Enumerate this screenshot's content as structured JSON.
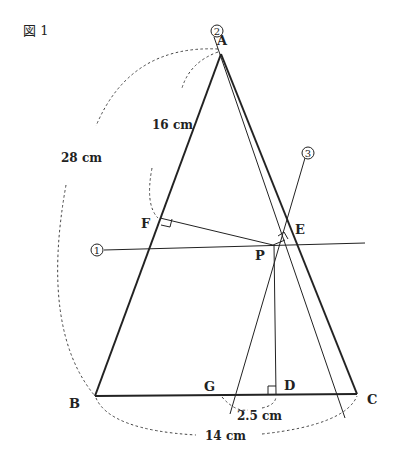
{
  "figure": {
    "title": "図 1",
    "points": {
      "A": "A",
      "B": "B",
      "C": "C",
      "D": "D",
      "E": "E",
      "F": "F",
      "G": "G",
      "P": "P"
    },
    "lines": {
      "line1": "1",
      "line2": "2",
      "line3": "3"
    },
    "measurements": {
      "AF": "16 cm",
      "AB": "28 cm",
      "BC": "14 cm",
      "GD": "2.5 cm"
    },
    "colors": {
      "stroke": "#222222",
      "dash": "#444444",
      "background": "#ffffff"
    }
  }
}
